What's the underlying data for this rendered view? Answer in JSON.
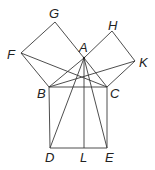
{
  "diagram": {
    "points": {
      "A": {
        "x": 84,
        "y": 58,
        "label": "A",
        "lx": 79,
        "ly": 52
      },
      "B": {
        "x": 49,
        "y": 87,
        "label": "B",
        "lx": 37,
        "ly": 98
      },
      "C": {
        "x": 107,
        "y": 87,
        "label": "C",
        "lx": 110,
        "ly": 98
      },
      "D": {
        "x": 50,
        "y": 148,
        "label": "D",
        "lx": 45,
        "ly": 162
      },
      "E": {
        "x": 107,
        "y": 148,
        "label": "E",
        "lx": 105,
        "ly": 162
      },
      "L": {
        "x": 84,
        "y": 148,
        "label": "L",
        "lx": 80,
        "ly": 162
      },
      "F": {
        "x": 21,
        "y": 53,
        "label": "F",
        "lx": 7,
        "ly": 59
      },
      "G": {
        "x": 55,
        "y": 22,
        "label": "G",
        "lx": 49,
        "ly": 18
      },
      "H": {
        "x": 112,
        "y": 31,
        "label": "H",
        "lx": 108,
        "ly": 30
      },
      "K": {
        "x": 135,
        "y": 61,
        "label": "K",
        "lx": 139,
        "ly": 67
      }
    },
    "segments": [
      [
        "F",
        "G"
      ],
      [
        "G",
        "A"
      ],
      [
        "F",
        "B"
      ],
      [
        "A",
        "B"
      ],
      [
        "A",
        "H"
      ],
      [
        "H",
        "K"
      ],
      [
        "K",
        "C"
      ],
      [
        "A",
        "C"
      ],
      [
        "B",
        "C"
      ],
      [
        "B",
        "D"
      ],
      [
        "D",
        "E"
      ],
      [
        "C",
        "E"
      ],
      [
        "A",
        "L"
      ],
      [
        "A",
        "D"
      ],
      [
        "A",
        "E"
      ],
      [
        "F",
        "C"
      ],
      [
        "B",
        "K"
      ]
    ],
    "stroke_color": "#3a3a3a"
  }
}
